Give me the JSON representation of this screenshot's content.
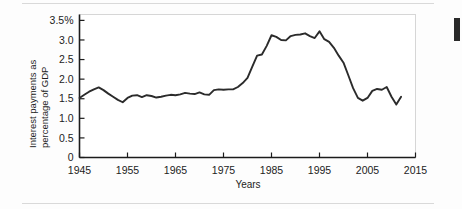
{
  "page": {
    "background_color": "#fdfdfd",
    "rule_color": "#d9d9d9",
    "edge_marker_color": "#2a2a2a"
  },
  "chart_data": {
    "type": "line",
    "title": "",
    "xlabel": "Years",
    "ylabel_line1": "Interest payments as",
    "ylabel_line2": "percentage of GDP",
    "line_color": "#2b2b2b",
    "axis_color": "#1c1c1c",
    "grid": false,
    "legend": null,
    "xlim": [
      1945,
      2015
    ],
    "ylim": [
      0,
      3.65
    ],
    "xticks": [
      1945,
      1955,
      1965,
      1975,
      1985,
      1995,
      2005,
      2015
    ],
    "xtick_labels": [
      "1945",
      "1955",
      "1965",
      "1975",
      "1985",
      "1995",
      "2005",
      "2015"
    ],
    "yticks": [
      0,
      0.5,
      1.0,
      1.5,
      2.0,
      2.5,
      3.0,
      3.5
    ],
    "ytick_labels": [
      "0",
      "0.5",
      "1.0",
      "1.5",
      "2.0",
      "2.5",
      "3.0",
      "3.5%"
    ],
    "x": [
      1945,
      1946,
      1947,
      1948,
      1949,
      1950,
      1951,
      1952,
      1953,
      1954,
      1955,
      1956,
      1957,
      1958,
      1959,
      1960,
      1961,
      1962,
      1963,
      1964,
      1965,
      1966,
      1967,
      1968,
      1969,
      1970,
      1971,
      1972,
      1973,
      1974,
      1975,
      1976,
      1977,
      1978,
      1979,
      1980,
      1981,
      1982,
      1983,
      1984,
      1985,
      1986,
      1987,
      1988,
      1989,
      1990,
      1991,
      1992,
      1993,
      1994,
      1995,
      1996,
      1997,
      1998,
      1999,
      2000,
      2001,
      2002,
      2003,
      2004,
      2005,
      2006,
      2007,
      2008,
      2009,
      2010,
      2011,
      2012
    ],
    "values": [
      1.52,
      1.6,
      1.68,
      1.74,
      1.79,
      1.72,
      1.63,
      1.55,
      1.47,
      1.41,
      1.52,
      1.58,
      1.59,
      1.54,
      1.59,
      1.57,
      1.53,
      1.55,
      1.58,
      1.6,
      1.59,
      1.61,
      1.65,
      1.63,
      1.62,
      1.66,
      1.61,
      1.6,
      1.72,
      1.74,
      1.73,
      1.74,
      1.74,
      1.8,
      1.9,
      2.03,
      2.32,
      2.6,
      2.63,
      2.85,
      3.12,
      3.08,
      3.0,
      2.99,
      3.1,
      3.13,
      3.14,
      3.17,
      3.1,
      3.05,
      3.22,
      3.02,
      2.95,
      2.8,
      2.6,
      2.42,
      2.1,
      1.77,
      1.52,
      1.45,
      1.52,
      1.7,
      1.75,
      1.73,
      1.8,
      1.55,
      1.35,
      1.55
    ]
  }
}
